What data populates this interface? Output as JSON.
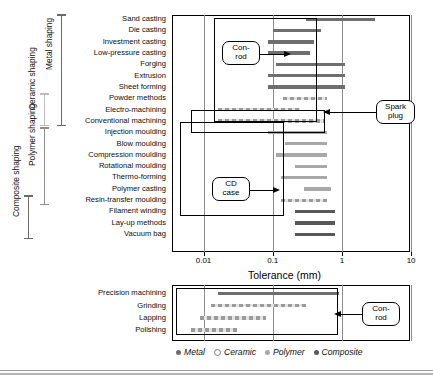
{
  "chart_data": {
    "type": "bar",
    "title": "",
    "xlabel": "Tolerance (mm)",
    "ylabel": "",
    "xscale": "log",
    "xlim": [
      0.004,
      10
    ],
    "xticks": [
      "0.01",
      "0.1",
      "1",
      "10"
    ],
    "grid": true,
    "legend_position": "bottom",
    "legend": [
      {
        "label": "Metal",
        "marker": "filled-circle",
        "color": "#6e6e6e"
      },
      {
        "label": "Ceramic",
        "marker": "open-circle",
        "color": "#e4e4e4"
      },
      {
        "label": "Polymer",
        "marker": "filled-circle",
        "color": "#a8a8a8"
      },
      {
        "label": "Composite",
        "marker": "filled-circle",
        "color": "#585858"
      }
    ],
    "main_panel": {
      "categories": [
        "Sand casting",
        "Die casting",
        "Investment casting",
        "Low-pressure casting",
        "Forging",
        "Extrusion",
        "Sheet forming",
        "Powder methods",
        "Electro-machining",
        "Conventional machining",
        "Injection moulding",
        "Blow moulding",
        "Compression moulding",
        "Rotational moulding",
        "Thermo-forming",
        "Polymer casting",
        "Resin-transfer moulding",
        "Filament winding",
        "Lay-up methods",
        "Vacuum bag"
      ],
      "bars": [
        {
          "category": "Sand casting",
          "material": "metal",
          "low": 0.3,
          "high": 3.0
        },
        {
          "category": "Die casting",
          "material": "metal",
          "low": 0.1,
          "high": 0.5
        },
        {
          "category": "Investment casting",
          "material": "metal",
          "low": 0.085,
          "high": 0.4
        },
        {
          "category": "Low-pressure casting",
          "material": "metal",
          "low": 0.085,
          "high": 0.35
        },
        {
          "category": "Forging",
          "material": "metal",
          "low": 0.11,
          "high": 1.1
        },
        {
          "category": "Extrusion",
          "material": "metal",
          "low": 0.085,
          "high": 1.1
        },
        {
          "category": "Sheet forming",
          "material": "metal",
          "low": 0.085,
          "high": 1.1
        },
        {
          "category": "Powder methods",
          "material": "ceramic",
          "low": 0.14,
          "high": 0.6
        },
        {
          "category": "Electro-machining",
          "material": "ceramic",
          "low": 0.016,
          "high": 0.25
        },
        {
          "category": "Conventional machining",
          "material": "ceramic",
          "low": 0.016,
          "high": 0.55
        },
        {
          "category": "Injection moulding",
          "material": "polymer",
          "low": 0.085,
          "high": 0.6
        },
        {
          "category": "Blow moulding",
          "material": "polymer",
          "low": 0.15,
          "high": 0.6
        },
        {
          "category": "Compression moulding",
          "material": "polymer",
          "low": 0.11,
          "high": 0.6
        },
        {
          "category": "Rotational moulding",
          "material": "polymer",
          "low": 0.21,
          "high": 0.6
        },
        {
          "category": "Thermo-forming",
          "material": "polymer",
          "low": 0.13,
          "high": 0.6
        },
        {
          "category": "Polymer casting",
          "material": "polymer",
          "low": 0.28,
          "high": 0.7
        },
        {
          "category": "Resin-transfer moulding",
          "material": "ceramic",
          "low": 0.13,
          "high": 0.6
        },
        {
          "category": "Filament winding",
          "material": "composite",
          "low": 0.21,
          "high": 0.8
        },
        {
          "category": "Lay-up methods",
          "material": "composite",
          "low": 0.21,
          "high": 0.8
        },
        {
          "category": "Vacuum bag",
          "material": "composite",
          "low": 0.21,
          "high": 0.8
        }
      ],
      "group_brackets": [
        {
          "label": "Metal shaping",
          "from": "Sand casting",
          "to": "Conventional machining"
        },
        {
          "label": "Ceramic shaping",
          "from": "Powder methods",
          "to": "Conventional machining"
        },
        {
          "label": "Polymer shaping",
          "from": "Injection moulding",
          "to": "Resin-transfer moulding"
        },
        {
          "label": "Composite shaping",
          "from": "Resin-transfer moulding",
          "to": "Vacuum bag"
        }
      ],
      "annotations": [
        {
          "label": "Con-\nrod",
          "line1": "Con-",
          "line2": "rod",
          "points_to": "Forging"
        },
        {
          "label": "Spark\nplug",
          "line1": "Spark",
          "line2": "plug",
          "points_to": "Electro-machining"
        },
        {
          "label": "CD\ncase",
          "line1": "CD",
          "line2": "case",
          "points_to": "Rotational moulding"
        }
      ]
    },
    "lower_panel": {
      "categories": [
        "Precision machining",
        "Grinding",
        "Lapping",
        "Polishing"
      ],
      "bars": [
        {
          "category": "Precision machining",
          "material": "metal",
          "low": 0.016,
          "high": 0.9
        },
        {
          "category": "Grinding",
          "material": "ceramic",
          "low": 0.013,
          "high": 0.3
        },
        {
          "category": "Lapping",
          "material": "ceramic",
          "low": 0.009,
          "high": 0.08
        },
        {
          "category": "Polishing",
          "material": "ceramic",
          "low": 0.0065,
          "high": 0.03
        }
      ],
      "annotations": [
        {
          "label": "Con-\nrod",
          "line1": "Con-",
          "line2": "rod",
          "points_to": "Precision machining"
        }
      ]
    }
  },
  "colors": {
    "metal": "#6e6e6e",
    "ceramic": "#cfcfcf",
    "polymer": "#a8a8a8",
    "composite": "#585858",
    "axis": "#000000",
    "grid": "#8d8d8d"
  }
}
